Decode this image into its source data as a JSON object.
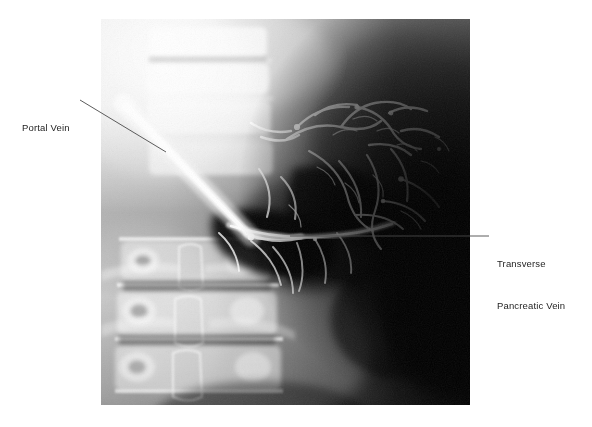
{
  "figure": {
    "kind": "medical-radiograph",
    "modality": "portal venogram",
    "region": "abdomen-lumbar-spine",
    "image_frame": {
      "x": 101,
      "y": 19,
      "width": 369,
      "height": 386
    },
    "background_color": "#ffffff",
    "film_dark_color": "#0a0a0a",
    "film_bright_color": "#f2f2f2"
  },
  "annotations": [
    {
      "id": "portal-vein",
      "label_line_1": "Portal Vein",
      "label_line_2": "",
      "text_color": "#1e1e1e",
      "leader": {
        "x1": 80,
        "y1": 100,
        "x2": 166,
        "y2": 152
      },
      "anchor_side": "left"
    },
    {
      "id": "transverse-pancreatic-vein",
      "label_line_1": "Transverse",
      "label_line_2": "Pancreatic Vein",
      "text_color": "#1e1e1e",
      "leader": {
        "x1": 290,
        "y1": 236,
        "x2": 489,
        "y2": 236
      },
      "anchor_side": "right"
    }
  ],
  "leader_style": {
    "color": "#4a4a4a",
    "width": 0.9
  }
}
